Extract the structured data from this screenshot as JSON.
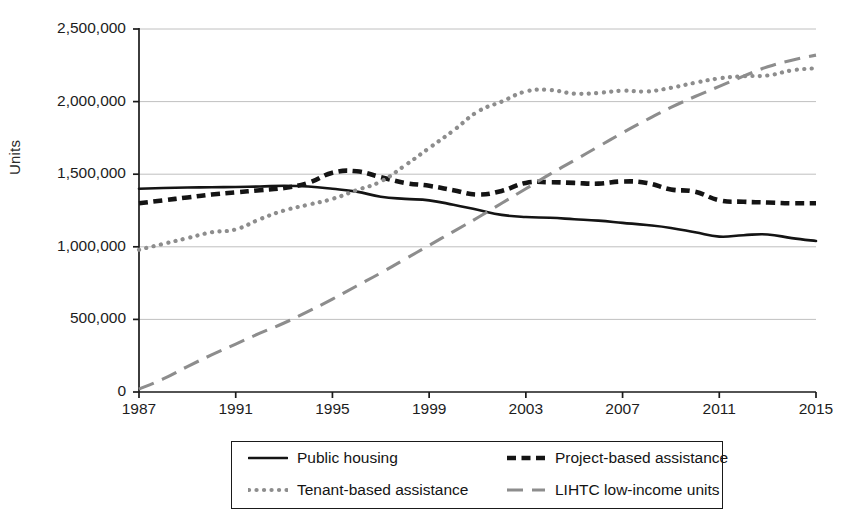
{
  "chart_data": {
    "type": "line",
    "title": "",
    "xlabel": "",
    "ylabel": "Units",
    "xlim": [
      1987,
      2015
    ],
    "ylim": [
      0,
      2500000
    ],
    "grid": true,
    "legend_position": "bottom",
    "y_ticks": [
      "0",
      "500,000",
      "1,000,000",
      "1,500,000",
      "2,000,000",
      "2,500,000"
    ],
    "y_tick_values": [
      0,
      500000,
      1000000,
      1500000,
      2000000,
      2500000
    ],
    "x_ticks": [
      "1987",
      "1991",
      "1995",
      "1999",
      "2003",
      "2007",
      "2011",
      "2015"
    ],
    "x_tick_values": [
      1987,
      1991,
      1995,
      1999,
      2003,
      2007,
      2011,
      2015
    ],
    "x": [
      1987,
      1988,
      1989,
      1990,
      1991,
      1992,
      1993,
      1994,
      1995,
      1996,
      1997,
      1998,
      1999,
      2000,
      2001,
      2002,
      2003,
      2004,
      2005,
      2006,
      2007,
      2008,
      2009,
      2010,
      2011,
      2012,
      2013,
      2014,
      2015
    ],
    "series": [
      {
        "name": "Public housing",
        "style": "solid",
        "color": "#141414",
        "values": [
          1400000,
          1405000,
          1408000,
          1410000,
          1412000,
          1415000,
          1420000,
          1415000,
          1400000,
          1380000,
          1345000,
          1330000,
          1320000,
          1290000,
          1255000,
          1220000,
          1205000,
          1200000,
          1190000,
          1180000,
          1165000,
          1150000,
          1130000,
          1100000,
          1070000,
          1080000,
          1085000,
          1060000,
          1040000
        ]
      },
      {
        "name": "Project-based assistance",
        "style": "dashed",
        "color": "#141414",
        "values": [
          1300000,
          1320000,
          1340000,
          1360000,
          1375000,
          1390000,
          1405000,
          1440000,
          1510000,
          1520000,
          1480000,
          1440000,
          1420000,
          1390000,
          1360000,
          1385000,
          1440000,
          1445000,
          1440000,
          1435000,
          1450000,
          1440000,
          1395000,
          1380000,
          1320000,
          1310000,
          1305000,
          1300000,
          1300000
        ]
      },
      {
        "name": "Tenant-based assistance",
        "style": "dotted",
        "color": "#8d8d8d",
        "values": [
          980000,
          1020000,
          1060000,
          1100000,
          1120000,
          1190000,
          1250000,
          1290000,
          1330000,
          1390000,
          1450000,
          1560000,
          1680000,
          1800000,
          1930000,
          2000000,
          2070000,
          2080000,
          2055000,
          2060000,
          2075000,
          2070000,
          2095000,
          2130000,
          2160000,
          2175000,
          2180000,
          2215000,
          2230000
        ]
      },
      {
        "name": "LIHTC low-income units",
        "style": "longdash",
        "color": "#8d8d8d",
        "values": [
          20000,
          90000,
          175000,
          255000,
          330000,
          405000,
          475000,
          555000,
          640000,
          730000,
          820000,
          915000,
          1010000,
          1105000,
          1200000,
          1300000,
          1400000,
          1500000,
          1595000,
          1690000,
          1785000,
          1875000,
          1960000,
          2035000,
          2105000,
          2175000,
          2240000,
          2285000,
          2320000
        ]
      }
    ]
  },
  "legend": {
    "items": [
      {
        "label": "Public housing",
        "style": "solid",
        "color": "#141414"
      },
      {
        "label": "Project-based assistance",
        "style": "dashed",
        "color": "#141414"
      },
      {
        "label": "Tenant-based assistance",
        "style": "dotted",
        "color": "#8d8d8d"
      },
      {
        "label": "LIHTC low-income units",
        "style": "longdash",
        "color": "#8d8d8d"
      }
    ]
  },
  "axes": {
    "axis_color": "#1a1a1a",
    "grid_color": "#b9b9b9"
  }
}
